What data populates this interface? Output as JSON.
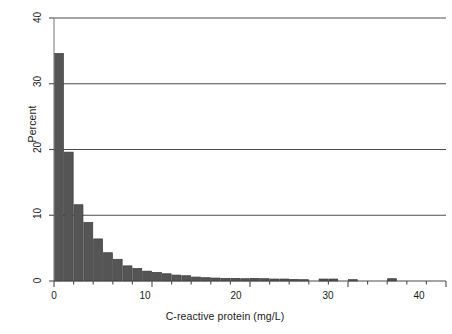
{
  "chart_data": {
    "type": "bar",
    "title": "",
    "subtitle": "",
    "xlabel": "C-reactive protein (mg/L)",
    "ylabel": "Percent",
    "xlim": [
      0,
      40
    ],
    "ylim": [
      0,
      40
    ],
    "xticks": [
      0,
      10,
      20,
      30,
      40
    ],
    "xtick_labels": [
      "0",
      "10",
      "20",
      "30",
      "40"
    ],
    "x_minor_tick_interval": 2,
    "yticks": [
      0,
      10,
      20,
      30,
      40
    ],
    "ytick_labels": [
      "0",
      "10",
      "20",
      "30",
      "40"
    ],
    "grid": "horizontal",
    "gridlines_at": [
      10,
      20,
      30,
      40
    ],
    "legend": "none",
    "legend_position": "none",
    "bar_color": "#555555",
    "bar_edge_color": "#3a3a3a",
    "grid_color": "#4d4d4d",
    "axis_color": "#808080",
    "bin_width": 1,
    "bin_unit": "mg/L",
    "categories": [
      "0-1",
      "1-2",
      "2-3",
      "3-4",
      "4-5",
      "5-6",
      "6-7",
      "7-8",
      "8-9",
      "9-10",
      "10-11",
      "11-12",
      "12-13",
      "13-14",
      "14-15",
      "15-16",
      "16-17",
      "17-18",
      "18-19",
      "19-20",
      "20-21",
      "21-22",
      "22-23",
      "23-24",
      "24-25",
      "25-26",
      "26-27",
      "27-28",
      "28-29",
      "29-30",
      "30-31",
      "31-32",
      "32-33",
      "33-34",
      "34-35",
      "35-36",
      "36-37",
      "37-38",
      "38-39",
      "39-40"
    ],
    "x": [
      0.5,
      1.5,
      2.5,
      3.5,
      4.5,
      5.5,
      6.5,
      7.5,
      8.5,
      9.5,
      10.5,
      11.5,
      12.5,
      13.5,
      14.5,
      15.5,
      16.5,
      17.5,
      18.5,
      19.5,
      20.5,
      21.5,
      22.5,
      23.5,
      24.5,
      25.5,
      26.5,
      27.5,
      28.5,
      29.5,
      30.5,
      31.5,
      32.5,
      33.5,
      34.5,
      35.5,
      36.5,
      37.5,
      38.5,
      39.5
    ],
    "values": [
      34.6,
      19.6,
      11.6,
      8.9,
      6.4,
      4.3,
      3.3,
      2.3,
      1.9,
      1.5,
      1.3,
      1.1,
      0.9,
      0.8,
      0.6,
      0.5,
      0.45,
      0.4,
      0.4,
      0.35,
      0.4,
      0.35,
      0.3,
      0.3,
      0.25,
      0.2,
      0.0,
      0.3,
      0.3,
      0.0,
      0.2,
      0.0,
      0.0,
      0.0,
      0.35,
      0.0,
      0.0,
      0.0,
      0.0,
      0.0
    ],
    "annotations": []
  }
}
